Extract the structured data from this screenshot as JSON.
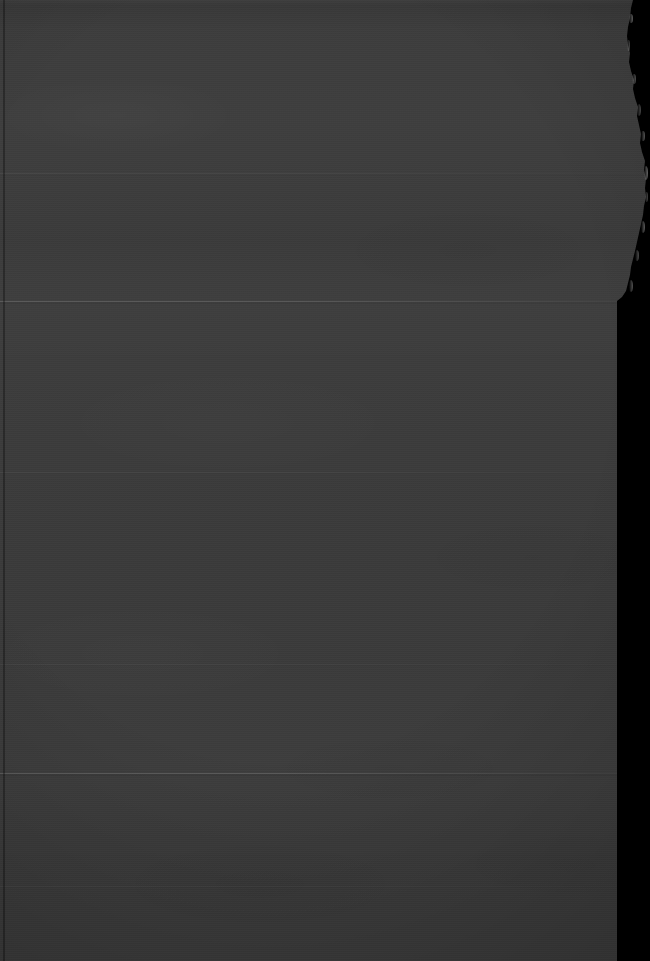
{
  "scene": {
    "description": "Severely underexposed photograph of a dark gray textured paper or cardboard sheet with a torn upper-right edge, set against a black background",
    "subject_name": "torn-gray-paper-sheet",
    "lighting": "very low light / underexposed",
    "has_text": false,
    "has_ui_elements": false,
    "width": 650,
    "height": 961
  },
  "colors": {
    "background": "#000000",
    "material_base": "#3b3b3b",
    "material_light": "#474747",
    "material_dark": "#2e2e2e",
    "crease_highlight": "#565656",
    "tear_rim_light": "#6e6e6e",
    "left_edge_shadow": "#242424"
  },
  "geometry": {
    "material_left_x": 0,
    "torn_edge_top_x": 633,
    "torn_edge_max_x": 646,
    "torn_edge_min_x": 627,
    "straight_edge_x": 617,
    "tear_ends_y": 301,
    "left_edge_line_x": 3
  },
  "creases": [
    {
      "name": "crease-upper-faint",
      "y": 173,
      "thickness": 1,
      "opacity": 0.055,
      "fade": "right"
    },
    {
      "name": "crease-primary-upper",
      "y": 301,
      "thickness": 1,
      "opacity": 0.15,
      "fade": "right"
    },
    {
      "name": "crease-mid-faint",
      "y": 472,
      "thickness": 1,
      "opacity": 0.045,
      "fade": "right"
    },
    {
      "name": "crease-lower-faint",
      "y": 664,
      "thickness": 1,
      "opacity": 0.035,
      "fade": "right"
    },
    {
      "name": "crease-primary-lower",
      "y": 773,
      "thickness": 1,
      "opacity": 0.16,
      "fade": "right"
    },
    {
      "name": "crease-bottom-faint",
      "y": 886,
      "thickness": 1,
      "opacity": 0.03,
      "fade": "right"
    }
  ],
  "tear_highlights": [
    {
      "name": "tear-glint-1",
      "x": 629,
      "y": 14,
      "w": 4,
      "h": 9,
      "opacity": 0.4
    },
    {
      "name": "tear-glint-2",
      "x": 627,
      "y": 40,
      "w": 3,
      "h": 11,
      "opacity": 0.3
    },
    {
      "name": "tear-glint-3",
      "x": 632,
      "y": 74,
      "w": 4,
      "h": 10,
      "opacity": 0.34
    },
    {
      "name": "tear-glint-4",
      "x": 637,
      "y": 104,
      "w": 4,
      "h": 12,
      "opacity": 0.3
    },
    {
      "name": "tear-glint-5",
      "x": 641,
      "y": 131,
      "w": 4,
      "h": 10,
      "opacity": 0.36
    },
    {
      "name": "tear-glint-6",
      "x": 644,
      "y": 166,
      "w": 4,
      "h": 14,
      "opacity": 0.44
    },
    {
      "name": "tear-glint-7",
      "x": 645,
      "y": 192,
      "w": 3,
      "h": 10,
      "opacity": 0.3
    },
    {
      "name": "tear-glint-8",
      "x": 641,
      "y": 221,
      "w": 4,
      "h": 12,
      "opacity": 0.38
    },
    {
      "name": "tear-glint-9",
      "x": 635,
      "y": 250,
      "w": 4,
      "h": 11,
      "opacity": 0.32
    },
    {
      "name": "tear-glint-10",
      "x": 629,
      "y": 280,
      "w": 4,
      "h": 12,
      "opacity": 0.34
    }
  ]
}
